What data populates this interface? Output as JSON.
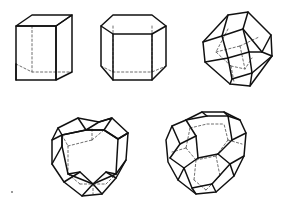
{
  "figure": {
    "background_color": "#ffffff",
    "visible_edge_color": "#111111",
    "hidden_edge_color": "#4a4a4a",
    "hidden_edge_style": "dashed",
    "width": 281,
    "height": 209,
    "layout": "two rows: three solids on top, two solids below",
    "shape_count": 5
  },
  "shapes": [
    {
      "id": "cube",
      "name": "Cube",
      "row": 1,
      "position": "top-left",
      "faces": 6,
      "vertices": 8,
      "edges": 12,
      "face_type": "square",
      "orientation": "upright, slight top-down perspective",
      "hidden_edges_shown": true
    },
    {
      "id": "hexagonal-prism",
      "name": "Hexagonal prism",
      "row": 1,
      "position": "top-center",
      "faces": 8,
      "vertices": 12,
      "edges": 18,
      "face_type": "hexagon and rectangle",
      "orientation": "upright, slight top-down perspective",
      "hidden_edges_shown": true
    },
    {
      "id": "rhombic-dodecahedron",
      "name": "Rhombic dodecahedron",
      "row": 1,
      "position": "top-right",
      "faces": 12,
      "vertices": 14,
      "edges": 24,
      "face_type": "rhombus",
      "orientation": "tilted on a vertex axis",
      "hidden_edges_shown": true
    },
    {
      "id": "truncated-octahedron-a",
      "name": "Truncated solid with hexagonal front face",
      "row": 2,
      "position": "bottom-left",
      "faces": 14,
      "vertices": 24,
      "edges": 36,
      "face_type": "hexagon and square",
      "orientation": "hexagonal face toward viewer",
      "hidden_edges_shown": true
    },
    {
      "id": "truncated-octahedron-b",
      "name": "Truncated octahedron",
      "row": 2,
      "position": "bottom-right",
      "faces": 14,
      "vertices": 24,
      "edges": 36,
      "face_type": "hexagon and square",
      "orientation": "square face on top, rotated",
      "hidden_edges_shown": true
    }
  ]
}
